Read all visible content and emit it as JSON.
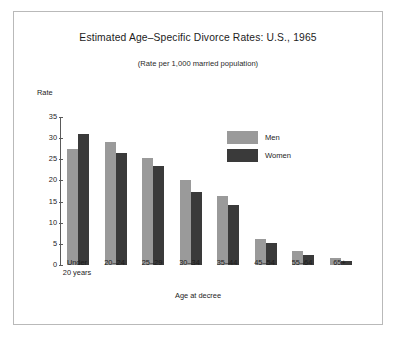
{
  "chart_data": {
    "type": "bar",
    "title": "Estimated Age–Specific Divorce Rates: U.S., 1965",
    "subtitle": "(Rate per 1,000 married population)",
    "xlabel": "Age at decree",
    "ylabel": "Rate",
    "ylim": [
      0,
      35
    ],
    "yticks": [
      0,
      5,
      10,
      15,
      20,
      25,
      30,
      35
    ],
    "grid": false,
    "legend_position": "upper-right-inside",
    "categories": [
      "Under 20 years",
      "20–24",
      "25–29",
      "30–34",
      "35–44",
      "45–54",
      "55–64",
      "65+"
    ],
    "series": [
      {
        "name": "Men",
        "color": "#9a9a9a",
        "values": [
          27.4,
          29.0,
          25.4,
          20.1,
          16.3,
          6.2,
          3.3,
          1.6
        ]
      },
      {
        "name": "Women",
        "color": "#3a3a3a",
        "values": [
          31.0,
          26.6,
          23.3,
          17.2,
          14.2,
          5.3,
          2.3,
          0.9
        ]
      }
    ]
  },
  "figure": {
    "border_color": "#b9b9b9",
    "background": "#ffffff"
  },
  "ytick_labels": [
    "0",
    "5",
    "10",
    "15",
    "20",
    "25",
    "30",
    "35"
  ],
  "xtick_labels": [
    {
      "line1": "Under",
      "line2": "20 years"
    },
    {
      "line1": "20–24",
      "line2": ""
    },
    {
      "line1": "25–29",
      "line2": ""
    },
    {
      "line1": "30–34",
      "line2": ""
    },
    {
      "line1": "35–44",
      "line2": ""
    },
    {
      "line1": "45–54",
      "line2": ""
    },
    {
      "line1": "55–64",
      "line2": ""
    },
    {
      "line1": "65+",
      "line2": ""
    }
  ],
  "legend": {
    "items": [
      {
        "label": "Men",
        "color": "#9a9a9a"
      },
      {
        "label": "Women",
        "color": "#3a3a3a"
      }
    ]
  }
}
